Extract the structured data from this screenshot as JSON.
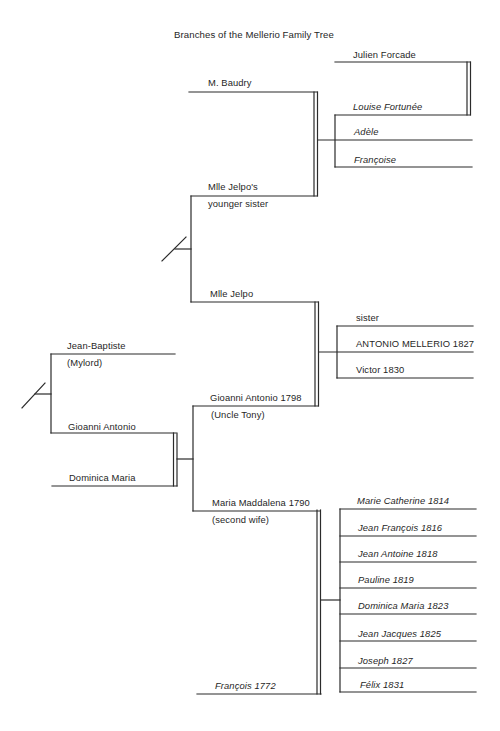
{
  "title": "Branches of the Mellerio Family Tree",
  "founders": {
    "jean_baptiste": {
      "name": "Jean-Baptiste",
      "note": "(Mylord)"
    },
    "gioanni_antonio": {
      "name": "Gioanni Antonio"
    },
    "dominica_maria": {
      "name": "Dominica Maria"
    }
  },
  "jelpo_family": {
    "m_baudry": "M. Baudry",
    "mlle_jelpos_sister": {
      "name": "Mlle Jelpo's",
      "note": "younger sister"
    },
    "mlle_jelpo": "Mlle Jelpo"
  },
  "baudry_children": {
    "julien_forcade": "Julien Forcade",
    "louise_fortunee": "Louise Fortunée",
    "adele": "Adèle",
    "francoise": "Françoise"
  },
  "uncle_tony": {
    "name": "Gioanni Antonio 1798",
    "note": "(Uncle Tony)"
  },
  "uncle_tony_children": [
    "sister",
    "ANTONIO MELLERIO 1827",
    "Victor 1830"
  ],
  "maria_maddalena": {
    "name": "Maria Maddalena 1790",
    "note": "(second wife)"
  },
  "francois": {
    "name": "François 1772"
  },
  "francois_children": [
    "Marie Catherine 1814",
    "Jean François 1816",
    "Jean Antoine 1818",
    "Pauline 1819",
    "Dominica Maria 1823",
    "Jean Jacques 1825",
    "Joseph 1827",
    "Félix 1831"
  ]
}
